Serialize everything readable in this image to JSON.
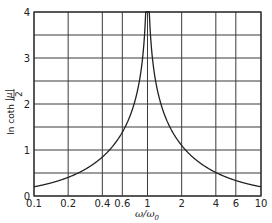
{
  "chart_data": {
    "type": "line",
    "title": "",
    "xlabel": "ω/ω₀",
    "ylabel": "ln coth |μ|/2",
    "xscale": "log",
    "xlim": [
      0.1,
      10
    ],
    "ylim": [
      0,
      4
    ],
    "grid": true,
    "x_ticks": [
      0.1,
      0.2,
      0.4,
      0.6,
      1,
      2,
      4,
      6,
      10
    ],
    "x_tick_labels": [
      "0.1",
      "0.2",
      "0.4",
      "0.6",
      "1",
      "2",
      "4",
      "6",
      "10"
    ],
    "y_ticks": [
      0,
      1,
      2,
      3,
      4
    ],
    "y_tick_labels": [
      "0",
      "1",
      "2",
      "3",
      "4"
    ],
    "y_gridlines": [
      0,
      0.5,
      1,
      1.5,
      2,
      2.5,
      3,
      3.5,
      4
    ],
    "series": [
      {
        "name": "ln coth(|ln(ω/ω0)|/2)",
        "x": [
          0.1,
          0.15,
          0.2,
          0.3,
          0.4,
          0.5,
          0.6,
          0.7,
          0.8,
          0.9,
          0.95,
          0.98,
          1.02,
          1.05,
          1.11,
          1.25,
          1.43,
          1.67,
          2,
          2.5,
          3.33,
          5,
          6.67,
          10
        ],
        "values": [
          0.2,
          0.3,
          0.41,
          0.62,
          0.85,
          1.1,
          1.39,
          1.73,
          2.2,
          2.94,
          3.66,
          4.0,
          4.0,
          3.66,
          2.94,
          2.2,
          1.73,
          1.39,
          1.1,
          0.85,
          0.62,
          0.41,
          0.3,
          0.2
        ],
        "color": "#222222"
      }
    ],
    "legend": null
  },
  "axes": {
    "xlabel_main": "ω/ω",
    "xlabel_sub": "0",
    "ylabel_prefix": "ln coth",
    "ylabel_numer": "|μ|",
    "ylabel_denom": "2"
  },
  "colors": {
    "grid": "#3a3a3a",
    "curve": "#222222",
    "background": "#ffffff"
  }
}
